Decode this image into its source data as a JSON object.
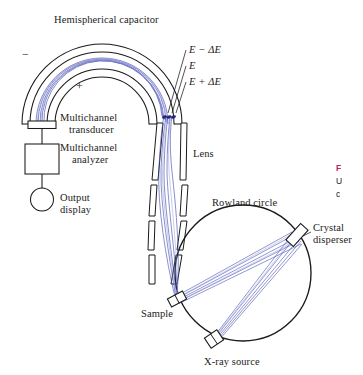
{
  "figure": {
    "domain": "Diagram",
    "title_internal": "X-ray photoelectron spectrometer schematic",
    "background_color": "#ffffff",
    "ink_color": "#1a1a1a",
    "ray_color": "#4b52b4",
    "ray_color_light": "#8f95d6"
  },
  "labels": {
    "hemispherical_capacitor": "Hemispherical capacitor",
    "polarity_negative": "−",
    "polarity_positive": "+",
    "energy_minus": "E − ΔE",
    "energy_center": "E",
    "energy_plus": "E + ΔE",
    "multichannel_transducer_line1": "Multichannel",
    "multichannel_transducer_line2": "transducer",
    "multichannel_analyzer_line1": "Multichannel",
    "multichannel_analyzer_line2": "analyzer",
    "output_display_line1": "Output",
    "output_display_line2": "display",
    "lens": "Lens",
    "rowland_circle": "Rowland circle",
    "crystal_disperser_line1": "Crystal",
    "crystal_disperser_line2": "disperser",
    "sample": "Sample",
    "xray_source": "X-ray source"
  },
  "caption": {
    "line1_bold": "F",
    "line2": "U",
    "line3": "c",
    "accent_color": "#c0245a",
    "note": "caption text is cropped at the right edge of the screenshot"
  },
  "components": [
    {
      "name": "hemispherical-capacitor",
      "type": "concentric-arcs",
      "count": 3
    },
    {
      "name": "multichannel-transducer",
      "type": "rectangle-small"
    },
    {
      "name": "multichannel-analyzer",
      "type": "rectangle-large"
    },
    {
      "name": "output-display",
      "type": "circle"
    },
    {
      "name": "electrostatic-lens",
      "type": "electrode-plate-pairs",
      "count": 5
    },
    {
      "name": "rowland-circle",
      "type": "circle"
    },
    {
      "name": "crystal-disperser",
      "type": "tilted-plate"
    },
    {
      "name": "sample",
      "type": "tilted-plate"
    },
    {
      "name": "xray-source",
      "type": "tilted-plate"
    }
  ],
  "ray_paths": {
    "description": "blue electron and x-ray trajectories",
    "xray_bundle_count": 5,
    "photoelectron_bundle_count": 5
  }
}
